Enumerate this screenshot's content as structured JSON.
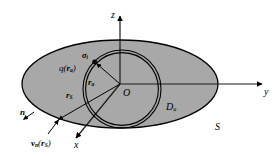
{
  "figure": {
    "kind": "geometry-diagram",
    "colors": {
      "background": "#ffffff",
      "surface_fill": "#a8a8a8",
      "outline": "#000000",
      "axis": "#1a1a1a",
      "vector": "#000000"
    }
  },
  "axes": {
    "z_label": "z",
    "y_label": "y",
    "x_label": "x",
    "origin_label": "O"
  },
  "labels": {
    "sigma_i": {
      "base": "σ",
      "sub": "i"
    },
    "q_ra": {
      "text": "q(",
      "base": "r",
      "sub": "a",
      "close": ")"
    },
    "r_a": {
      "base": "r",
      "sub": "a"
    },
    "r_S": {
      "base": "r",
      "sub": "S"
    },
    "n": {
      "base": "n"
    },
    "v_n_rS": {
      "base": "v",
      "sub": "n",
      "open": "(",
      "vec": "r",
      "vecsub": "S",
      "close": ")"
    },
    "D_a": {
      "base": "D",
      "sub": "a"
    },
    "S": {
      "base": "S"
    }
  }
}
